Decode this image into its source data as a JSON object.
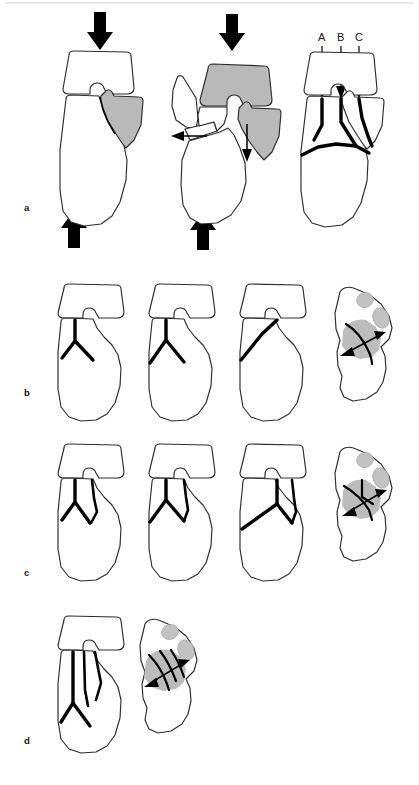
{
  "figure": {
    "background_color": "#ffffff",
    "shade_color": "#b9b9b9",
    "line_color": "#000000",
    "outline_color": "#2b2b2b",
    "width": 419,
    "height": 785
  },
  "row_labels": {
    "a": "a",
    "b": "b",
    "c": "c",
    "d": "d"
  },
  "panel_a": {
    "label": "a",
    "force_arrow_labels": {
      "axial_top": "",
      "axial_bottom": "",
      "lateral_displacement": "",
      "inferior_displacement": ""
    },
    "cut_level_labels": [
      "A",
      "B",
      "C"
    ],
    "panels": [
      {
        "name": "intact-lateral-view",
        "caption": ""
      },
      {
        "name": "displaced-lateral-view",
        "caption": ""
      },
      {
        "name": "fracture-lines-lateral-view",
        "caption": ""
      }
    ]
  },
  "panel_b": {
    "label": "b",
    "panels": [
      {
        "name": "lateral-view-1",
        "caption": ""
      },
      {
        "name": "lateral-view-2",
        "caption": ""
      },
      {
        "name": "lateral-view-3",
        "caption": ""
      },
      {
        "name": "axial-view",
        "caption": ""
      }
    ]
  },
  "panel_c": {
    "label": "c",
    "panels": [
      {
        "name": "lateral-view-1",
        "caption": ""
      },
      {
        "name": "lateral-view-2",
        "caption": ""
      },
      {
        "name": "lateral-view-3",
        "caption": ""
      },
      {
        "name": "axial-view",
        "caption": ""
      }
    ]
  },
  "panel_d": {
    "label": "d",
    "panels": [
      {
        "name": "lateral-view-1",
        "caption": ""
      },
      {
        "name": "axial-view",
        "caption": ""
      }
    ]
  }
}
